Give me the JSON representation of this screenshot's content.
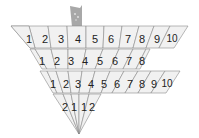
{
  "diagram": {
    "tab": {
      "color": "#a9a9a9"
    },
    "rows": [
      {
        "labels": [
          "1",
          "2",
          "3",
          "4",
          "5",
          "6",
          "7",
          "8",
          "9",
          "10"
        ]
      },
      {
        "labels": [
          "1",
          "2",
          "3",
          "4",
          "5",
          "6",
          "7",
          "8"
        ]
      },
      {
        "labels": [
          "1",
          "2",
          "3",
          "4",
          "5",
          "6",
          "7",
          "8",
          "9",
          "10"
        ]
      },
      {
        "labels": [
          "2",
          "1",
          "1",
          "2"
        ]
      }
    ],
    "colors": {
      "cell_fill": "#f1f1f1",
      "cell_stroke": "#8a8a8a",
      "text": "#222222"
    }
  }
}
